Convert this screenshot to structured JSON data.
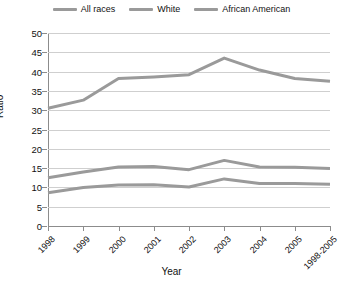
{
  "chart_data": {
    "type": "line",
    "title": "",
    "xlabel": "Year",
    "ylabel": "Ratio",
    "ylim": [
      0,
      50
    ],
    "yticks": [
      0,
      5,
      10,
      15,
      20,
      25,
      30,
      35,
      40,
      45,
      50
    ],
    "grid": true,
    "legend_position": "top-center",
    "categories": [
      "1998",
      "1999",
      "2000",
      "2001",
      "2002",
      "2003",
      "2004",
      "2005",
      "1998-2005"
    ],
    "series": [
      {
        "name": "All races",
        "values": [
          12.5,
          14.0,
          15.3,
          15.4,
          14.6,
          17.0,
          15.3,
          15.2,
          14.9
        ]
      },
      {
        "name": "White",
        "values": [
          8.6,
          10.0,
          10.6,
          10.7,
          10.1,
          12.2,
          11.0,
          11.0,
          10.8
        ]
      },
      {
        "name": "African American",
        "values": [
          30.5,
          32.6,
          38.2,
          38.6,
          39.2,
          43.5,
          40.4,
          38.2,
          37.5
        ]
      }
    ],
    "series_colors": [
      "#9a9a9a",
      "#9a9a9a",
      "#9a9a9a"
    ]
  },
  "legend": {
    "items": [
      {
        "label": "All races"
      },
      {
        "label": "White"
      },
      {
        "label": "African American"
      }
    ]
  },
  "axes": {
    "y_title": "Ratio",
    "x_title": "Year"
  }
}
